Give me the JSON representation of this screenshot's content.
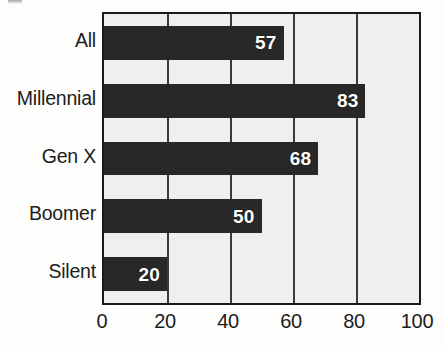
{
  "chart_data": {
    "type": "bar",
    "orientation": "horizontal",
    "title": "",
    "subtitle": "",
    "xlabel": "",
    "ylabel": "",
    "categories": [
      "All",
      "Millennial",
      "Gen X",
      "Boomer",
      "Silent"
    ],
    "values": [
      57,
      83,
      68,
      50,
      20
    ],
    "data_labels": [
      "57",
      "83",
      "68",
      "50",
      "20"
    ],
    "xlim": [
      0,
      100
    ],
    "xticks": [
      0,
      20,
      40,
      60,
      80,
      100
    ],
    "xtick_labels": [
      "0",
      "20",
      "40",
      "60",
      "80",
      "100"
    ],
    "gridlines": "vertical",
    "grid": true,
    "legend": false,
    "legend_position": "none",
    "annotations": []
  },
  "style": {
    "bar_color": "#282828",
    "plot_background": "#efefed",
    "page_background": "#fdfdfc",
    "axis_color": "#1a1a1a",
    "gridline_color": "#3a3a3a",
    "label_color": "#1c1c1c",
    "value_label_color": "#ffffff"
  }
}
